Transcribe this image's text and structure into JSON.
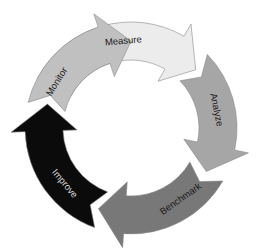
{
  "diagram": {
    "type": "cycle",
    "center": [
      131,
      128
    ],
    "outer_radius": 106,
    "inner_radius": 68,
    "head_extra": 14,
    "head_length_deg": 18,
    "segments": [
      {
        "label": "Measure",
        "start_deg": -152,
        "end_deg": -42,
        "fill": "#ececec",
        "text_color": "#1a1a1a",
        "label_deg": -95
      },
      {
        "label": "Analyze",
        "start_deg": -44,
        "end_deg": 30,
        "fill": "#a6a6a6",
        "text_color": "#1a1a1a",
        "label_deg": -12
      },
      {
        "label": "Benchmark",
        "start_deg": 30,
        "end_deg": 112,
        "fill": "#787878",
        "text_color": "#1a1a1a",
        "label_deg": 55
      },
      {
        "label": "Improve",
        "start_deg": 110,
        "end_deg": 196,
        "fill": "#0b0b0b",
        "text_color": "#d8d8d8",
        "label_deg": 140
      },
      {
        "label": "Monitor",
        "start_deg": 194,
        "end_deg": 270,
        "fill": "#c0c0c0",
        "text_color": "#1a1a1a",
        "label_deg": 212
      }
    ],
    "stroke": "#8a8a8a"
  }
}
